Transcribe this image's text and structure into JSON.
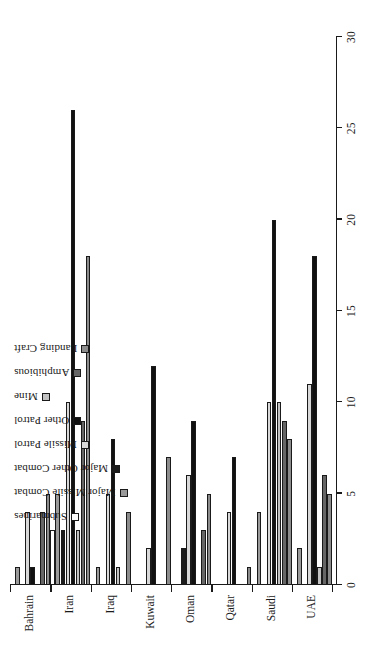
{
  "chart_data": {
    "type": "bar",
    "orientation": "vertical-rotated",
    "title": "",
    "xlabel": "",
    "ylabel": "",
    "ylim": [
      0,
      30
    ],
    "grid": false,
    "legend_position": "upper-left",
    "categories": [
      "Bahrain",
      "Iran",
      "Iraq",
      "Kuwait",
      "Oman",
      "Qatar",
      "Saudi",
      "UAE"
    ],
    "tick_labels": [
      "0",
      "5",
      "10",
      "15",
      "20",
      "25",
      "30"
    ],
    "tick_values": [
      0,
      5,
      10,
      15,
      20,
      25,
      30
    ],
    "series": [
      {
        "name": "Submarines",
        "color": "#ffffff",
        "values": [
          0,
          3,
          0,
          0,
          0,
          0,
          0,
          0
        ]
      },
      {
        "name": "Major Missile Combat",
        "color": "#9a9a9a",
        "values": [
          1,
          5,
          1,
          0,
          0,
          0,
          4,
          2
        ]
      },
      {
        "name": "Major Other Combat",
        "color": "#1c1c1c",
        "values": [
          0,
          3,
          0,
          0,
          2,
          0,
          0,
          0
        ]
      },
      {
        "name": "Missile Patrol",
        "color": "#d8d8d8",
        "values": [
          4,
          10,
          5,
          2,
          6,
          4,
          10,
          11
        ]
      },
      {
        "name": "Other Patrol",
        "color": "#111111",
        "values": [
          1,
          26,
          8,
          12,
          9,
          7,
          20,
          18
        ]
      },
      {
        "name": "Mine",
        "color": "#c2c2c2",
        "values": [
          0,
          3,
          1,
          0,
          0,
          0,
          10,
          1
        ]
      },
      {
        "name": "Amphibious",
        "color": "#666666",
        "values": [
          4,
          9,
          0,
          0,
          3,
          0,
          9,
          6
        ]
      },
      {
        "name": "Landing Craft",
        "color": "#8c8c8c",
        "values": [
          5,
          18,
          4,
          7,
          5,
          1,
          8,
          5
        ]
      }
    ]
  },
  "legend": {
    "items": [
      {
        "label": "Submarines"
      },
      {
        "label": "Major Missile Combat"
      },
      {
        "label": "Major Other Combat"
      },
      {
        "label": "Missile Patrol"
      },
      {
        "label": "Other Patrol"
      },
      {
        "label": "Mine"
      },
      {
        "label": "Amphibious"
      },
      {
        "label": "Landing Craft"
      }
    ]
  }
}
